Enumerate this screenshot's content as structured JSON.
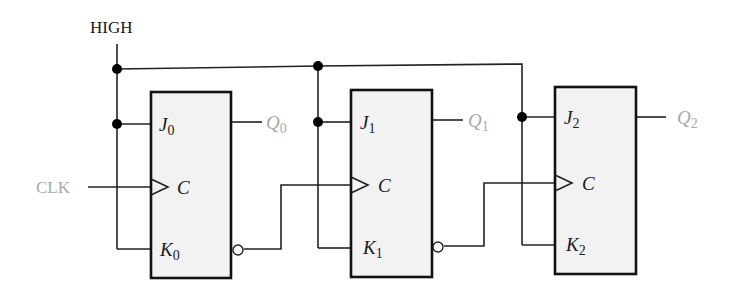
{
  "diagram": {
    "type": "logic-circuit",
    "inputs": {
      "high_label": "HIGH",
      "clk_label": "CLK"
    },
    "colors": {
      "wire": "#222222",
      "box_fill": "#f2f2f2",
      "box_stroke": "#111111",
      "output_label": "#a8a8a8",
      "clk_label": "#a8a8a8",
      "high_label": "#1a1a1a"
    },
    "flip_flops": [
      {
        "j": "J",
        "j_sub": "0",
        "c": "C",
        "k": "K",
        "k_sub": "0",
        "q": "Q",
        "q_sub": "0"
      },
      {
        "j": "J",
        "j_sub": "1",
        "c": "C",
        "k": "K",
        "k_sub": "1",
        "q": "Q",
        "q_sub": "1"
      },
      {
        "j": "J",
        "j_sub": "2",
        "c": "C",
        "k": "K",
        "k_sub": "2",
        "q": "Q",
        "q_sub": "2"
      }
    ]
  }
}
